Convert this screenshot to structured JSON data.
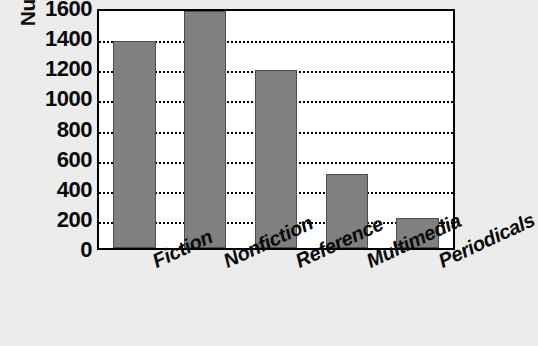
{
  "chart_data": {
    "type": "bar",
    "title": "",
    "xlabel": "",
    "ylabel": "Number of items",
    "categories": [
      "Fiction",
      "Nonfiction",
      "Reference",
      "Multimedia",
      "Periodicals"
    ],
    "values": [
      1400,
      1600,
      1200,
      500,
      200
    ],
    "ylim": [
      0,
      1600
    ],
    "ytick_values": [
      0,
      200,
      400,
      600,
      800,
      1000,
      1200,
      1400,
      1600
    ],
    "ytick_labels": [
      "0",
      "200",
      "400",
      "600",
      "800",
      "1000",
      "1200",
      "1400",
      "1600"
    ],
    "grid": true,
    "gridline_style": "dotted",
    "legend": null,
    "legend_position": "none",
    "bar_color": "#808080",
    "bar_edge_color": "#4d4d4d",
    "plot_background": "#ffffff",
    "figure_background": "#ececec",
    "axis_color": "#000000",
    "xtick_label_rotation": -25
  }
}
